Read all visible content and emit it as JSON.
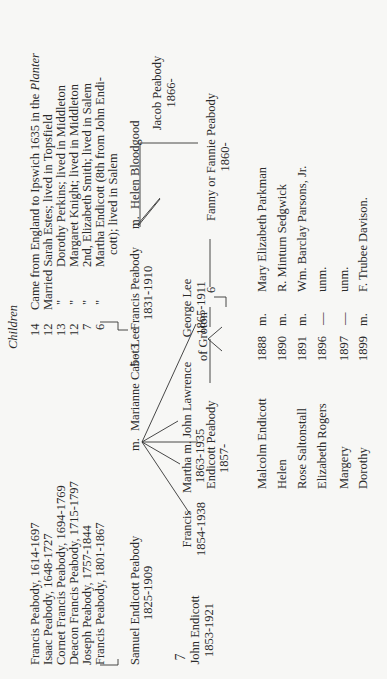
{
  "page": {
    "page_number": "7",
    "children_header": "Children"
  },
  "ancestors": [
    {
      "name": "Francis Peabody, 1614-1697",
      "children": "14",
      "note": "Came from England to Ipswich 1635 in the ",
      "note_ship": "Planter"
    },
    {
      "name": "Isaac Peabody, 1648-1727",
      "children": "12",
      "note": "Married Sarah Estes; lived in Topsfield"
    },
    {
      "name": "Cornet Francis Peabody, 1694-1769",
      "children": "13",
      "ditto": "\"",
      "note": "Dorothy Perkins; lived in Middleton"
    },
    {
      "name": "Deacon Francis Peabody, 1715-1797",
      "children": "12",
      "ditto": "\"",
      "note": "Margaret Knight; lived in Middleton"
    },
    {
      "name": "Joseph Peabody, 1757-1844",
      "children": "7",
      "ditto": "\"",
      "note": "2nd, Elizabeth Smith; lived in Salem"
    },
    {
      "name": "Francis Peabody, 1801-1867",
      "children": "6",
      "ditto": "\"",
      "note": "Martha Endicott (8th from John Endi-",
      "note_cont": "cott); lived in Salem"
    }
  ],
  "generation_samuel": {
    "name": "Samuel Endicott Peabody",
    "dates": "1825-1909",
    "m": "m.",
    "spouse": "Marianne Cabot Lee",
    "count": "5 - 3"
  },
  "generation_francis": {
    "name": "Francis Peabody",
    "dates": "1831-1910",
    "m": "m.",
    "spouse": "Helen Bloodgood"
  },
  "samuel_children": [
    {
      "name": "John Endicott",
      "dates": "1853-1921"
    },
    {
      "name": "Francis",
      "dates": "1854-1938"
    },
    {
      "name": "Martha m. John Lawrence",
      "dates": "1863-1935",
      "note": "of  Groton"
    },
    {
      "name": "George Lee",
      "dates": "1865-1911"
    }
  ],
  "endicott": {
    "name": "Endicott Peabody",
    "dates": "1857-",
    "count": "6"
  },
  "francis_children": [
    {
      "name": "Jacob Peabody",
      "dates": "1866-"
    },
    {
      "name": "Fanny or Fannie Peabody",
      "dates": "1860-"
    }
  ],
  "grandchildren": [
    {
      "name": "Malcolm Endicott",
      "year": "1888",
      "m": "m.",
      "spouse": "Mary Elizabeth Parkman"
    },
    {
      "name": "Helen",
      "year": "1890",
      "m": "m.",
      "spouse": "R. Minturn Sedgwick"
    },
    {
      "name": "Rose Saltonstall",
      "year": "1891",
      "m": "m.",
      "spouse": "Wm. Barclay Parsons, Jr."
    },
    {
      "name": "Elizabeth Rogers",
      "year": "1896",
      "m": "—",
      "spouse": "unm."
    },
    {
      "name": "Margery",
      "year": "1897",
      "m": "—",
      "spouse": "unm."
    },
    {
      "name": "Dorothy",
      "year": "1899",
      "m": "m.",
      "spouse": "F. Trubee Davison."
    }
  ]
}
